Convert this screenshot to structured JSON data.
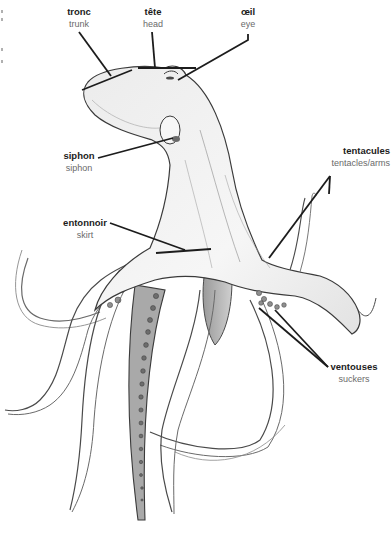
{
  "diagram": {
    "colors": {
      "background": "#ffffff",
      "leader_line": "#1c1c1c",
      "outline": "#3a3a3a",
      "body_fill": "#f1f1f1",
      "shade": "#bdbdbd",
      "sucker_fill": "#8a8a8a",
      "label_primary": "#1c1c1c",
      "label_secondary": "#6a6a6a"
    },
    "labels": [
      {
        "id": "tronc",
        "fr": "tronc",
        "en": "trunk"
      },
      {
        "id": "tete",
        "fr": "tête",
        "en": "head"
      },
      {
        "id": "oeil",
        "fr": "œil",
        "en": "eye"
      },
      {
        "id": "siphon",
        "fr": "siphon",
        "en": "siphon"
      },
      {
        "id": "entonnoir",
        "fr": "entonnoir",
        "en": "skirt"
      },
      {
        "id": "tentacules",
        "fr": "tentacules",
        "en": "tentacles/arms"
      },
      {
        "id": "ventouses",
        "fr": "ventouses",
        "en": "suckers"
      }
    ]
  }
}
